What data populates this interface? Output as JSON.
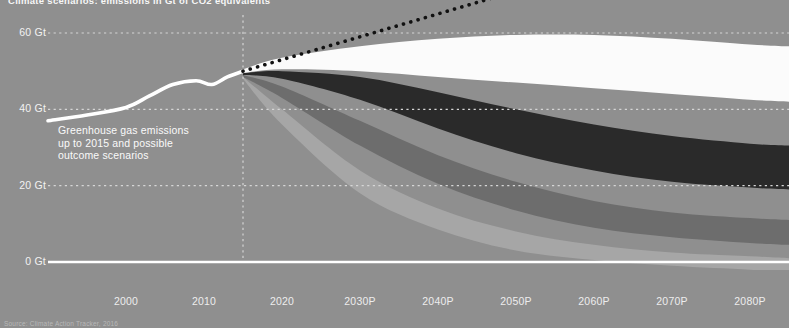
{
  "header": {
    "title": "Climate scenarios: emissions in Gt of CO2 equivalents"
  },
  "footer": {
    "source": "Source: Climate Action Tracker, 2016"
  },
  "annotation": {
    "text": "Greenhouse gas emissions\nup to 2015 and possible\noutcome scenarios"
  },
  "colors": {
    "background": "#8f8f8f",
    "gridline": "#d6d6d6",
    "baseline": "#ffffff",
    "historical_line": "#ffffff",
    "bau_dotted_line": "#111111",
    "band_white": "#fbfbfb",
    "band_black": "#2a2a2a",
    "band_dark_gray": "#6d6d6d",
    "band_mid_gray": "#7e7e7e",
    "band_light_gray": "#a6a6a6",
    "band_pale_gray": "#bdbdbd",
    "text": "#f2f2f2"
  },
  "chart_data": {
    "type": "area",
    "title": "Climate scenarios: emissions in Gt of CO2 equivalents",
    "xlabel": "",
    "ylabel": "Gt CO2e",
    "ylim": [
      0,
      70
    ],
    "xlim": [
      1990,
      2085
    ],
    "grid": true,
    "legend_position": "none",
    "y_ticks": [
      0,
      20,
      40,
      60
    ],
    "y_tick_labels": [
      "0 Gt",
      "20 Gt",
      "40 Gt",
      "60 Gt"
    ],
    "x_ticks": [
      2000,
      2010,
      2020,
      2030,
      2040,
      2050,
      2060,
      2070,
      2080
    ],
    "x_tick_labels": [
      "2000",
      "2010",
      "2020",
      "2030P",
      "2040P",
      "2050P",
      "2060P",
      "2070P",
      "2080P"
    ],
    "projection_start_year": 2015,
    "historical": {
      "name": "Greenhouse gas emissions up to 2015",
      "style": "line",
      "color": "#ffffff",
      "x": [
        1990,
        1995,
        2000,
        2003,
        2006,
        2009,
        2011,
        2013,
        2015
      ],
      "values": [
        37.0,
        38.5,
        40.5,
        43.5,
        46.5,
        47.5,
        46.5,
        48.5,
        50.0
      ]
    },
    "bau_line": {
      "name": "Business as usual (no climate policies)",
      "style": "dotted-line",
      "color": "#111111",
      "x": [
        2015,
        2025,
        2035,
        2045,
        2055
      ],
      "values": [
        50.0,
        56.0,
        62.0,
        68.0,
        74.0
      ]
    },
    "series": [
      {
        "name": "Current policy projections (upper bound)",
        "color": "#fbfbfb",
        "x": [
          2015,
          2020,
          2030,
          2040,
          2050,
          2060,
          2070,
          2080,
          2085
        ],
        "values": [
          50.5,
          53.5,
          56.5,
          58.5,
          59.5,
          59.5,
          58.5,
          57.0,
          56.5
        ]
      },
      {
        "name": "Current policy projections (lower bound)",
        "color": "#fbfbfb",
        "x": [
          2015,
          2020,
          2030,
          2040,
          2050,
          2060,
          2070,
          2080,
          2085
        ],
        "values": [
          49.5,
          50.5,
          50.0,
          48.5,
          47.0,
          45.5,
          44.0,
          42.5,
          42.0
        ]
      },
      {
        "name": "Pledges and targets (upper bound)",
        "color": "#2a2a2a",
        "x": [
          2015,
          2020,
          2030,
          2040,
          2050,
          2060,
          2070,
          2080,
          2085
        ],
        "values": [
          49.5,
          50.0,
          48.5,
          44.5,
          40.0,
          36.0,
          33.0,
          31.0,
          30.5
        ]
      },
      {
        "name": "Pledges and targets (lower bound)",
        "color": "#2a2a2a",
        "x": [
          2015,
          2020,
          2030,
          2040,
          2050,
          2060,
          2070,
          2080,
          2085
        ],
        "values": [
          49.0,
          48.0,
          42.5,
          35.0,
          28.5,
          24.0,
          21.0,
          19.5,
          19.0
        ]
      },
      {
        "name": "2 degree consistent (upper bound)",
        "color": "#6d6d6d",
        "x": [
          2015,
          2020,
          2030,
          2040,
          2050,
          2060,
          2070,
          2080,
          2085
        ],
        "values": [
          49.0,
          46.0,
          37.0,
          28.0,
          21.0,
          16.0,
          13.0,
          11.5,
          11.0
        ]
      },
      {
        "name": "2 degree consistent (lower bound)",
        "color": "#6d6d6d",
        "x": [
          2015,
          2020,
          2030,
          2040,
          2050,
          2060,
          2070,
          2080,
          2085
        ],
        "values": [
          48.5,
          43.0,
          30.5,
          20.5,
          13.5,
          9.0,
          6.5,
          5.0,
          4.5
        ]
      },
      {
        "name": "1.5 degree consistent (upper bound)",
        "color": "#a6a6a6",
        "x": [
          2015,
          2020,
          2030,
          2040,
          2050,
          2060,
          2070,
          2080,
          2085
        ],
        "values": [
          48.5,
          40.0,
          24.0,
          14.0,
          8.0,
          4.5,
          2.5,
          1.5,
          1.0
        ]
      },
      {
        "name": "1.5 degree consistent (lower bound)",
        "color": "#bdbdbd",
        "x": [
          2015,
          2020,
          2030,
          2040,
          2050,
          2060,
          2070,
          2080,
          2085
        ],
        "values": [
          48.0,
          36.0,
          18.0,
          8.5,
          3.0,
          0.5,
          -1.0,
          -2.0,
          -2.5
        ]
      }
    ]
  }
}
